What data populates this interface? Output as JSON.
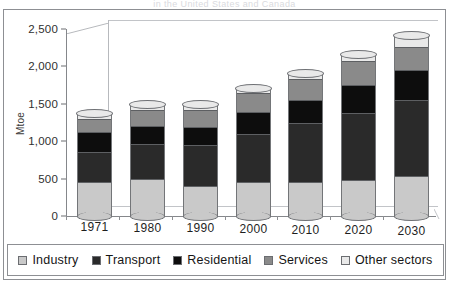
{
  "title": "in the United States and Canada",
  "axis": {
    "ylabel": "Mtoe",
    "yticks": [
      "0",
      "500",
      "1,000",
      "1,500",
      "2,000",
      "2,500"
    ]
  },
  "legend": {
    "items": [
      {
        "label": "Industry",
        "color": "#c9c9c9"
      },
      {
        "label": "Transport",
        "color": "#2a2a2a"
      },
      {
        "label": "Residential",
        "color": "#0d0d0d"
      },
      {
        "label": "Services",
        "color": "#8a8a8a"
      },
      {
        "label": "Other sectors",
        "color": "#e9e9e9"
      }
    ]
  },
  "chart_data": {
    "type": "bar",
    "title": "in the United States and Canada",
    "xlabel": "",
    "ylabel": "Mtoe",
    "ylim": [
      0,
      2500
    ],
    "ytick_step": 500,
    "grid": false,
    "stacked": true,
    "legend_position": "bottom",
    "categories": [
      "1971",
      "1980",
      "1990",
      "2000",
      "2010",
      "2020",
      "2030"
    ],
    "series": [
      {
        "name": "Industry",
        "color": "#c9c9c9",
        "values": [
          450,
          500,
          400,
          450,
          460,
          480,
          540
        ]
      },
      {
        "name": "Transport",
        "color": "#2a2a2a",
        "values": [
          410,
          460,
          550,
          650,
          790,
          900,
          1010
        ]
      },
      {
        "name": "Residential",
        "color": "#0d0d0d",
        "values": [
          260,
          240,
          240,
          290,
          300,
          370,
          400
        ]
      },
      {
        "name": "Services",
        "color": "#8a8a8a",
        "values": [
          180,
          220,
          230,
          250,
          280,
          320,
          310
        ]
      },
      {
        "name": "Other sectors",
        "color": "#e9e9e9",
        "values": [
          60,
          60,
          60,
          60,
          70,
          80,
          140
        ]
      }
    ],
    "totals": [
      1360,
      1480,
      1480,
      1700,
      1900,
      2150,
      2400
    ]
  }
}
